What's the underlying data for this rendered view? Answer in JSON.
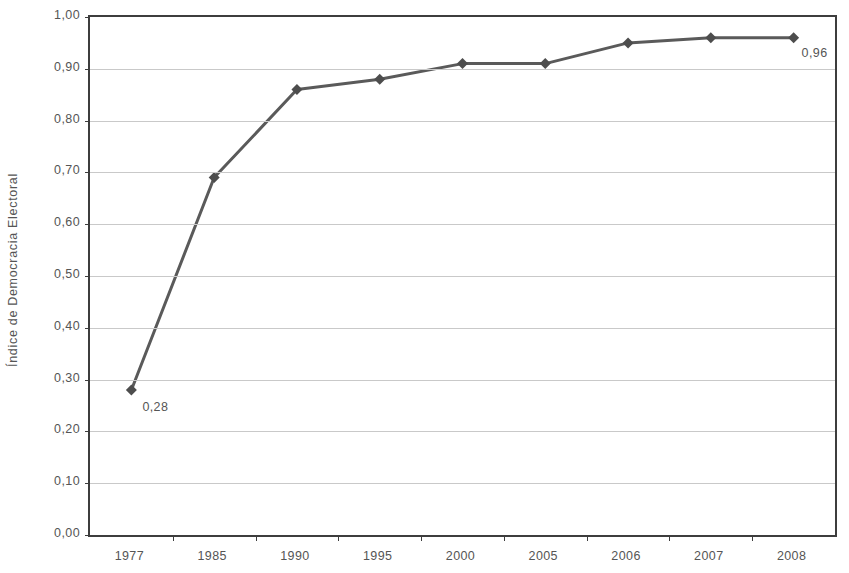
{
  "chart_data": {
    "type": "line",
    "title": "",
    "subtitle": "",
    "xlabel": "",
    "ylabel": "Índice de Democracia Electoral",
    "categories": [
      "1977",
      "1985",
      "1990",
      "1995",
      "2000",
      "2005",
      "2006",
      "2007",
      "2008"
    ],
    "values": [
      0.28,
      0.69,
      0.86,
      0.88,
      0.91,
      0.91,
      0.95,
      0.96,
      0.96
    ],
    "point_labels": [
      "0,28",
      "",
      "",
      "",
      "",
      "",
      "",
      "",
      "0,96"
    ],
    "series": [
      {
        "name": "Índice de Democracia Electoral",
        "values": [
          0.28,
          0.69,
          0.86,
          0.88,
          0.91,
          0.91,
          0.95,
          0.96,
          0.96
        ]
      }
    ],
    "ylim": [
      0.0,
      1.0
    ],
    "ytick_values": [
      0.0,
      0.1,
      0.2,
      0.3,
      0.4,
      0.5,
      0.6,
      0.7,
      0.8,
      0.9,
      1.0
    ],
    "ytick_labels": [
      "0,00",
      "0,10",
      "0,20",
      "0,30",
      "0,40",
      "0,50",
      "0,60",
      "0,70",
      "0,80",
      "0,90",
      "1,00"
    ],
    "grid": true,
    "grid_axis": "y",
    "legend": false,
    "legend_position": "none",
    "marker": "diamond",
    "line_color": "#5a5a5a",
    "marker_color": "#4d4d4d",
    "grid_color": "#c9c9c9",
    "axis_color": "#3d3d3d",
    "text_color": "#555555",
    "background_color": "#ffffff",
    "annotations": [
      {
        "text": "0,28",
        "category": "1977",
        "value": 0.28
      },
      {
        "text": "0,96",
        "category": "2008",
        "value": 0.96
      }
    ]
  }
}
